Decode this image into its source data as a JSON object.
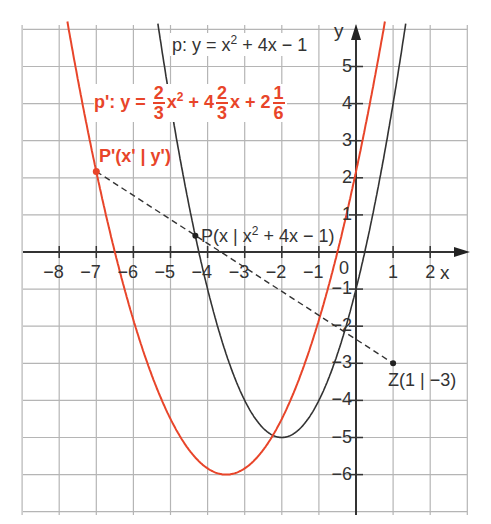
{
  "diagram": {
    "type": "coordinate-plot",
    "axes": {
      "x_label": "x",
      "y_label": "y",
      "x_ticks": [
        "−8",
        "−7",
        "−6",
        "−5",
        "−4",
        "−3",
        "−2",
        "−1",
        "1",
        "2"
      ],
      "y_ticks": [
        "5",
        "4",
        "3",
        "2",
        "1",
        "−1",
        "−2",
        "−3",
        "−4",
        "−5",
        "−6"
      ],
      "origin_label": "0",
      "x_range": [
        -9,
        3
      ],
      "y_range": [
        -7,
        6
      ]
    },
    "curves": [
      {
        "name": "p",
        "equation_label": "p: y = x² + 4x − 1",
        "color": "#333333",
        "a": 1,
        "b": 4,
        "c": -1
      },
      {
        "name": "p'",
        "equation_label": "p': y = 2/3 x² + 4 2/3 x + 2 1/6",
        "color": "#e8452a",
        "a": 0.6667,
        "b": 4.6667,
        "c": 2.1667
      }
    ],
    "points": [
      {
        "name": "Z",
        "label": "Z(1 | −3)",
        "x": 1,
        "y": -3
      },
      {
        "name": "P",
        "label": "P(x | x² + 4x − 1)",
        "x": -4.33,
        "y": 0.44
      },
      {
        "name": "P'",
        "label": "P'(x' | y')",
        "x": -7,
        "y": 2.17
      }
    ],
    "labels": {
      "p_prefix": "p: y = x",
      "p_suffix": " + 4x − 1",
      "sq": "2",
      "pp_prefix": "p': y = ",
      "pp_x2": "x",
      "pp_plus4": " + 4",
      "pp_x": "x + 2",
      "frac_num_2": "2",
      "frac_den_3": "3",
      "frac_num_1": "1",
      "frac_den_6": "6",
      "Pprime": "P'(x' | y')",
      "P_prefix": "P(x | x",
      "P_suffix": " + 4x − 1)",
      "Z": "Z(1 | −3)"
    }
  }
}
